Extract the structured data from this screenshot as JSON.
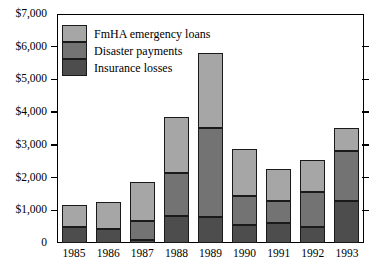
{
  "chart_data": {
    "type": "bar",
    "stacked": true,
    "title": "",
    "subtitle": "",
    "xlabel": "",
    "ylabel": "",
    "categories": [
      "1985",
      "1986",
      "1987",
      "1988",
      "1989",
      "1990",
      "1991",
      "1992",
      "1993"
    ],
    "series": [
      {
        "name": "Insurance losses",
        "color": "#4d4d4d",
        "values": [
          480,
          430,
          100,
          840,
          790,
          540,
          600,
          490,
          1270
        ]
      },
      {
        "name": "Disaster payments",
        "color": "#737373",
        "values": [
          0,
          0,
          580,
          1310,
          2730,
          910,
          670,
          1070,
          1530
        ]
      },
      {
        "name": "FmHA emergency loans",
        "color": "#a6a6a6",
        "values": [
          670,
          810,
          1200,
          1700,
          2280,
          1430,
          980,
          980,
          710
        ]
      }
    ],
    "totals": [
      1150,
      1240,
      1880,
      3850,
      5800,
      2880,
      2250,
      2540,
      3510
    ],
    "ylim": [
      0,
      7000
    ],
    "ytick_values": [
      0,
      1000,
      2000,
      3000,
      4000,
      5000,
      6000,
      7000
    ],
    "ytick_labels": [
      "0",
      "$1,000",
      "$2,000",
      "$3,000",
      "$4,000",
      "$5,000",
      "$6,000",
      "$7,000"
    ],
    "grid": false,
    "legend_position": "top-left",
    "legend_order": [
      "FmHA emergency loans",
      "Disaster payments",
      "Insurance losses"
    ]
  },
  "legend": {
    "items": [
      {
        "label": "FmHA emergency loans",
        "color": "#a6a6a6"
      },
      {
        "label": "Disaster payments",
        "color": "#737373"
      },
      {
        "label": "Insurance losses",
        "color": "#4d4d4d"
      }
    ]
  },
  "axes": {
    "y_labels": [
      "$7,000",
      "$6,000",
      "$5,000",
      "$4,000",
      "$3,000",
      "$2,000",
      "$1,000",
      "0"
    ],
    "x_labels": [
      "1985",
      "1986",
      "1987",
      "1988",
      "1989",
      "1990",
      "1991",
      "1992",
      "1993"
    ]
  },
  "colors": {
    "fmha": "#a6a6a6",
    "disaster": "#737373",
    "insurance": "#4d4d4d",
    "axis": "#000000",
    "background": "#ffffff"
  }
}
